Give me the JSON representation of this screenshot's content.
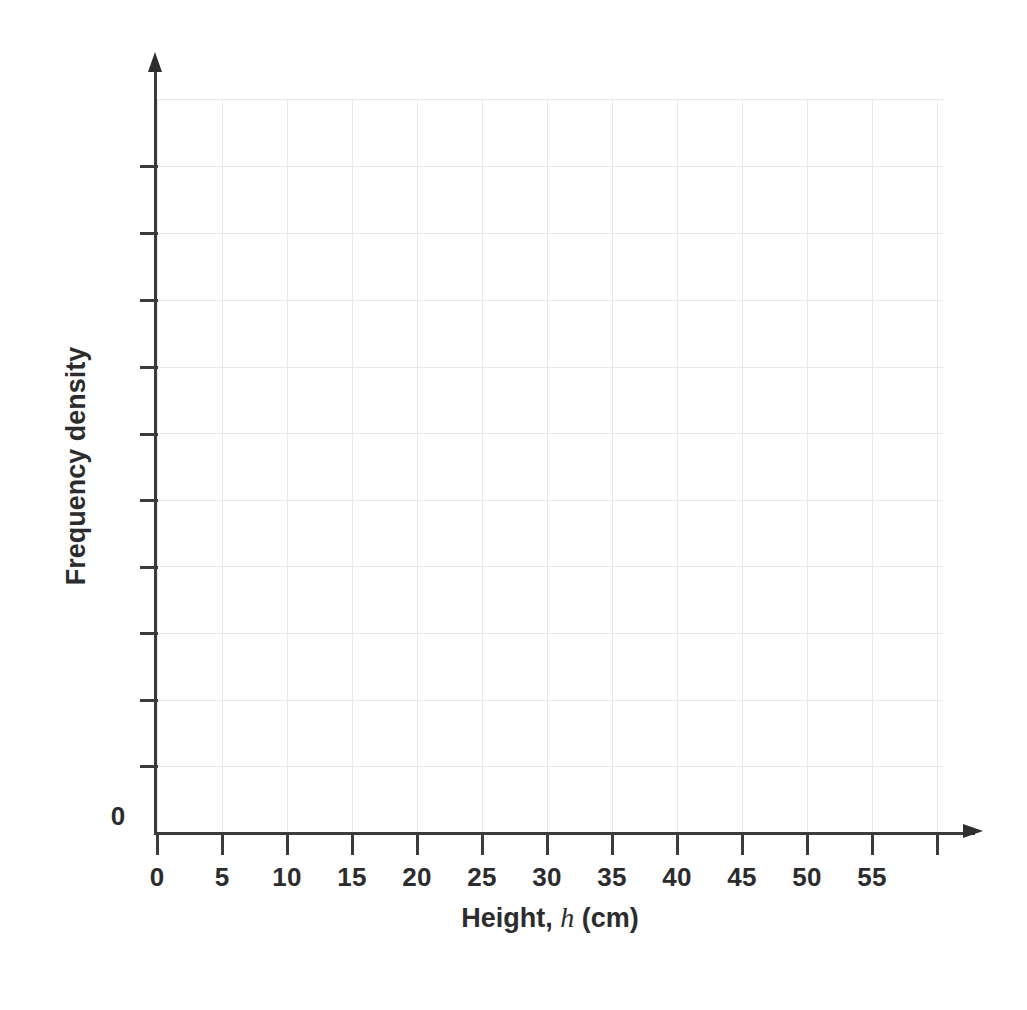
{
  "chart_data": {
    "type": "bar",
    "title": "",
    "subtitle": "",
    "xlabel_prefix": "Height, ",
    "xlabel_variable": "h",
    "xlabel_suffix": " (cm)",
    "xlabel_full": "Height, h (cm)",
    "ylabel": "Frequency density",
    "categories": [],
    "values": [],
    "series": [],
    "annotations": [],
    "legend": null,
    "legend_position": "none",
    "grid": true,
    "grid_color": "#e9e9ec",
    "axis_color": "#3b3b3d",
    "background_color": "#ffffff",
    "x_axis": {
      "origin_label": "0",
      "tick_labels": [
        "0",
        "5",
        "10",
        "15",
        "20",
        "25",
        "30",
        "35",
        "40",
        "45",
        "50",
        "55"
      ],
      "tick_values": [
        0,
        5,
        10,
        15,
        20,
        25,
        30,
        35,
        40,
        45,
        50,
        55
      ],
      "tick_count_total": 13,
      "tick_interval": 5,
      "xlim": [
        0,
        60
      ],
      "arrow": true
    },
    "y_axis": {
      "origin_label": "0",
      "tick_labels": [
        "",
        "",
        "",
        "",
        "",
        "",
        "",
        "",
        "",
        ""
      ],
      "tick_count_total": 10,
      "ylim": [
        0,
        11
      ],
      "arrow": true,
      "labelled": false
    },
    "note": "Empty (blank) axes template for drawing a histogram / frequency density diagram; no data plotted."
  },
  "x_ticks": [
    {
      "label": "0",
      "x": 157
    },
    {
      "label": "5",
      "x": 222
    },
    {
      "label": "10",
      "x": 287
    },
    {
      "label": "15",
      "x": 352
    },
    {
      "label": "20",
      "x": 417
    },
    {
      "label": "25",
      "x": 482
    },
    {
      "label": "30",
      "x": 547
    },
    {
      "label": "35",
      "x": 612
    },
    {
      "label": "40",
      "x": 677
    },
    {
      "label": "45",
      "x": 742
    },
    {
      "label": "50",
      "x": 807
    },
    {
      "label": "55",
      "x": 872
    },
    {
      "label": "",
      "x": 937
    }
  ],
  "y_ticks": [
    {
      "label": "",
      "y": 166
    },
    {
      "label": "",
      "y": 233
    },
    {
      "label": "",
      "y": 300
    },
    {
      "label": "",
      "y": 367
    },
    {
      "label": "",
      "y": 434
    },
    {
      "label": "",
      "y": 500
    },
    {
      "label": "",
      "y": 567
    },
    {
      "label": "",
      "y": 633
    },
    {
      "label": "",
      "y": 700
    },
    {
      "label": "",
      "y": 766
    }
  ],
  "grid_vertical_x": [
    0,
    65,
    130,
    195,
    260,
    325,
    390,
    455,
    520,
    585,
    650,
    715,
    780
  ],
  "grid_horizontal_y": [
    0,
    67,
    134,
    201,
    268,
    334,
    401,
    467,
    534,
    601,
    667,
    734
  ]
}
